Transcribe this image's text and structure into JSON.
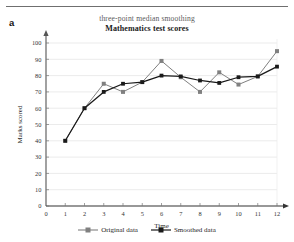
{
  "figure": {
    "panel_letter": "a",
    "title_sub": "three-point median smoothing",
    "title_main": "Mathematics test scores"
  },
  "legend": {
    "items": [
      {
        "label": "Original data",
        "color": "#808080",
        "marker": "square"
      },
      {
        "label": "Smoothed data",
        "color": "#1a1a1a",
        "marker": "square"
      }
    ]
  },
  "chart_data": {
    "type": "line",
    "title": "Mathematics test scores",
    "subtitle": "three-point median smoothing",
    "xlabel": "Time",
    "ylabel": "Marks scored",
    "xlim": [
      0,
      12
    ],
    "ylim": [
      0,
      100
    ],
    "xticks": [
      0,
      1,
      2,
      3,
      4,
      5,
      6,
      7,
      8,
      9,
      10,
      11,
      12
    ],
    "yticks": [
      0,
      10,
      20,
      30,
      40,
      50,
      60,
      70,
      80,
      90,
      100
    ],
    "grid": "horizontal",
    "legend_position": "bottom",
    "x": [
      1,
      2,
      3,
      4,
      5,
      6,
      7,
      8,
      9,
      10,
      11,
      12
    ],
    "series": [
      {
        "name": "Original data",
        "color": "#808080",
        "values": [
          40,
          60,
          75,
          70,
          76,
          89,
          79,
          70,
          82,
          74.5,
          79.5,
          95
        ]
      },
      {
        "name": "Smoothed data",
        "color": "#1a1a1a",
        "values": [
          40,
          60,
          70,
          75,
          76,
          80,
          79.5,
          77,
          75.5,
          79,
          79.5,
          85.5
        ]
      }
    ]
  }
}
